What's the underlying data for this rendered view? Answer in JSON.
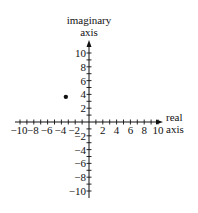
{
  "chart_data": {
    "type": "scatter",
    "title": "",
    "xlabel": "real axis",
    "ylabel": "imaginary axis",
    "xlabel_lines": [
      "real",
      "axis"
    ],
    "ylabel_lines": [
      "imaginary",
      "axis"
    ],
    "xlim": [
      -11,
      11
    ],
    "ylim": [
      -11,
      11
    ],
    "x_ticks": [
      -10,
      -8,
      -6,
      -4,
      -2,
      2,
      4,
      6,
      8,
      10
    ],
    "y_ticks": [
      10,
      8,
      6,
      4,
      2,
      -2,
      -4,
      -6,
      -8,
      -10
    ],
    "x_tick_labels": [
      "−10",
      "−8",
      "−6",
      "−4",
      "−2",
      "2",
      "4",
      "6",
      "8",
      "10"
    ],
    "y_tick_labels": [
      "10",
      "8",
      "6",
      "4",
      "2",
      "−2",
      "−4",
      "−6",
      "−8",
      "−10"
    ],
    "minor_tick_step": 1,
    "grid": false,
    "legend": null,
    "series": [
      {
        "name": "point",
        "points": [
          {
            "x": -3.5,
            "y": 3.5
          }
        ]
      }
    ]
  }
}
